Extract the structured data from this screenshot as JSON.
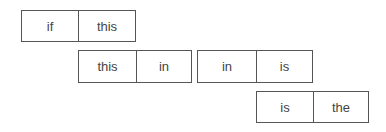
{
  "diagram": {
    "type": "word-bigram-chain",
    "pairs": [
      {
        "first": "if",
        "second": "this",
        "box": {
          "x": 21,
          "y": 10,
          "w": 115,
          "h": 32,
          "split": 57
        }
      },
      {
        "first": "this",
        "second": "in",
        "box": {
          "x": 78,
          "y": 50,
          "w": 114,
          "h": 33,
          "split": 58
        }
      },
      {
        "first": "in",
        "second": "is",
        "box": {
          "x": 197,
          "y": 50,
          "w": 116,
          "h": 33,
          "split": 59
        }
      },
      {
        "first": "is",
        "second": "the",
        "box": {
          "x": 256,
          "y": 91,
          "w": 113,
          "h": 32,
          "split": 57
        }
      }
    ],
    "colors": {
      "border": "#555555",
      "text": "#444444",
      "background": "#ffffff"
    }
  }
}
